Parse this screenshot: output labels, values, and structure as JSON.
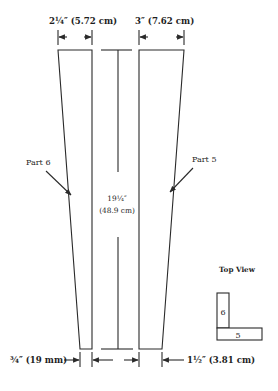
{
  "diagram": {
    "type": "woodworking cut diagram",
    "top_dimensions": {
      "left_width": "2¼″ (5.72 cm)",
      "right_width": "3″ (7.62 cm)"
    },
    "center_dimension": {
      "length_imperial": "19¼″",
      "length_metric": "(48.9 cm)"
    },
    "part_labels": {
      "left": "Part 6",
      "right": "Part 5"
    },
    "bottom_dimensions": {
      "left_width": "¾″ (19 mm)",
      "right_width": "1½″ (3.81 cm)"
    },
    "top_view": {
      "title": "Top View",
      "part_upper": "6",
      "part_lower": "5"
    },
    "colors": {
      "line": "#2a2a2a",
      "text": "#1e1e1e",
      "background": "#ffffff"
    }
  }
}
